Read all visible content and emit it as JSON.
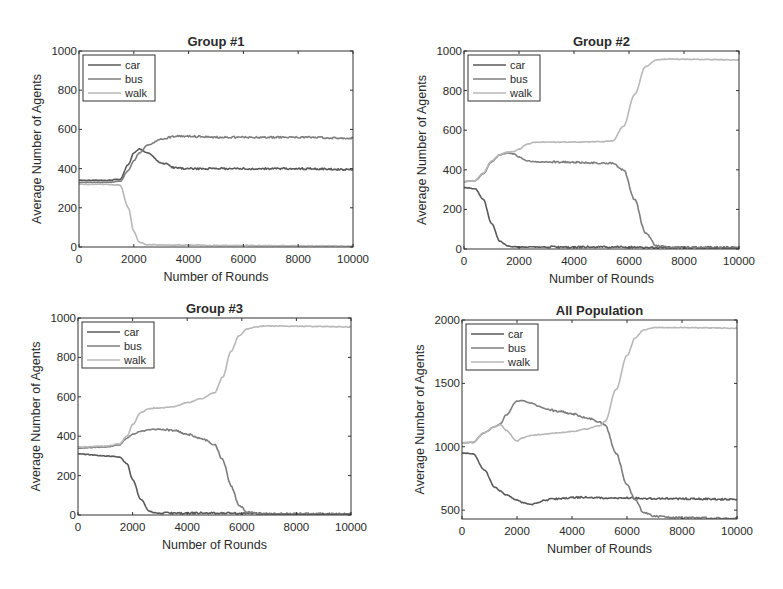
{
  "figure": {
    "background": "#ffffff",
    "colors": {
      "car": "#5a5a5a",
      "bus": "#7e7e7e",
      "walk": "#b8b8b8",
      "axis": "#333333"
    }
  },
  "chart_data": [
    {
      "type": "line",
      "title": "Group #1",
      "xlabel": "Number of Rounds",
      "ylabel": "Average Number of Agents",
      "xlim": [
        0,
        10000
      ],
      "ylim": [
        0,
        1000
      ],
      "xticks": [
        0,
        2000,
        4000,
        6000,
        8000,
        10000
      ],
      "yticks": [
        0,
        200,
        400,
        600,
        800,
        1000
      ],
      "grid": false,
      "legend": {
        "position": "upper left",
        "entries": [
          "car",
          "bus",
          "walk"
        ]
      },
      "box": {
        "x": 79,
        "y": 51,
        "w": 274,
        "h": 196
      },
      "x": [
        0,
        1000,
        1500,
        1800,
        2000,
        2200,
        2500,
        3000,
        3500,
        4000,
        5000,
        6000,
        8000,
        10000
      ],
      "series": [
        {
          "name": "car",
          "values": [
            340,
            340,
            345,
            420,
            480,
            500,
            480,
            430,
            405,
            400,
            400,
            400,
            400,
            395
          ]
        },
        {
          "name": "bus",
          "values": [
            330,
            330,
            335,
            390,
            440,
            480,
            520,
            550,
            565,
            565,
            560,
            560,
            560,
            555
          ]
        },
        {
          "name": "walk",
          "values": [
            320,
            320,
            315,
            200,
            80,
            25,
            12,
            10,
            10,
            10,
            8,
            8,
            6,
            5
          ]
        }
      ]
    },
    {
      "type": "line",
      "title": "Group #2",
      "xlabel": "Number of Rounds",
      "ylabel": "Average Number of Agents",
      "xlim": [
        0,
        10000
      ],
      "ylim": [
        0,
        1000
      ],
      "xticks": [
        0,
        2000,
        4000,
        6000,
        8000,
        10000
      ],
      "yticks": [
        0,
        200,
        400,
        600,
        800,
        1000
      ],
      "grid": false,
      "legend": {
        "position": "upper left",
        "entries": [
          "car",
          "bus",
          "walk"
        ]
      },
      "box": {
        "x": 464,
        "y": 51,
        "w": 275,
        "h": 198
      },
      "x": [
        0,
        400,
        700,
        1000,
        1300,
        1600,
        1800,
        2000,
        2300,
        2600,
        3000,
        4000,
        5000,
        5400,
        5800,
        6200,
        6600,
        7000,
        7500,
        8000,
        10000
      ],
      "series": [
        {
          "name": "car",
          "values": [
            310,
            305,
            250,
            130,
            40,
            15,
            12,
            10,
            10,
            10,
            10,
            10,
            10,
            10,
            10,
            10,
            8,
            8,
            8,
            8,
            8
          ]
        },
        {
          "name": "bus",
          "values": [
            340,
            345,
            380,
            440,
            475,
            485,
            480,
            465,
            445,
            440,
            440,
            438,
            435,
            432,
            400,
            250,
            80,
            15,
            8,
            6,
            5
          ]
        },
        {
          "name": "walk",
          "values": [
            340,
            345,
            385,
            445,
            478,
            490,
            492,
            505,
            530,
            540,
            540,
            540,
            542,
            545,
            620,
            780,
            920,
            955,
            960,
            958,
            955
          ]
        }
      ]
    },
    {
      "type": "line",
      "title": "Group #3",
      "xlabel": "Number of Rounds",
      "ylabel": "Average Number of Agents",
      "xlim": [
        0,
        10000
      ],
      "ylim": [
        0,
        1000
      ],
      "xticks": [
        0,
        2000,
        4000,
        6000,
        8000,
        10000
      ],
      "yticks": [
        0,
        200,
        400,
        600,
        800,
        1000
      ],
      "grid": false,
      "legend": {
        "position": "upper left",
        "entries": [
          "car",
          "bus",
          "walk"
        ]
      },
      "box": {
        "x": 78,
        "y": 318,
        "w": 273,
        "h": 197
      },
      "x": [
        0,
        1000,
        1500,
        1800,
        2000,
        2300,
        2600,
        2800,
        3000,
        3500,
        4000,
        4500,
        5000,
        5300,
        5600,
        5900,
        6200,
        6500,
        7000,
        8000,
        10000
      ],
      "series": [
        {
          "name": "car",
          "values": [
            310,
            300,
            295,
            260,
            180,
            80,
            20,
            12,
            10,
            10,
            10,
            10,
            10,
            10,
            10,
            8,
            8,
            8,
            6,
            5,
            5
          ]
        },
        {
          "name": "bus",
          "values": [
            340,
            345,
            355,
            390,
            410,
            425,
            432,
            435,
            435,
            430,
            410,
            390,
            360,
            280,
            150,
            50,
            15,
            8,
            5,
            5,
            5
          ]
        },
        {
          "name": "walk",
          "values": [
            345,
            350,
            360,
            400,
            460,
            520,
            540,
            542,
            543,
            550,
            570,
            590,
            620,
            700,
            830,
            910,
            945,
            955,
            960,
            958,
            955
          ]
        }
      ]
    },
    {
      "type": "line",
      "title": "All Population",
      "xlabel": "Number of Rounds",
      "ylabel": "Average Number of Agents",
      "xlim": [
        0,
        10000
      ],
      "ylim": [
        430,
        2000
      ],
      "xticks": [
        0,
        2000,
        4000,
        6000,
        8000,
        10000
      ],
      "yticks": [
        500,
        1000,
        1500,
        2000
      ],
      "grid": false,
      "legend": {
        "position": "upper left",
        "entries": [
          "car",
          "bus",
          "walk"
        ]
      },
      "box": {
        "x": 462,
        "y": 320,
        "w": 275,
        "h": 199
      },
      "x": [
        0,
        400,
        800,
        1200,
        1400,
        1600,
        2000,
        2200,
        2500,
        2800,
        3000,
        3500,
        4000,
        4500,
        5000,
        5200,
        5600,
        6000,
        6300,
        6600,
        7000,
        8000,
        10000
      ],
      "series": [
        {
          "name": "car",
          "values": [
            950,
            945,
            820,
            680,
            650,
            620,
            580,
            560,
            545,
            560,
            580,
            590,
            600,
            600,
            598,
            595,
            595,
            595,
            595,
            592,
            592,
            590,
            585
          ]
        },
        {
          "name": "bus",
          "values": [
            1030,
            1035,
            1110,
            1160,
            1180,
            1250,
            1360,
            1365,
            1345,
            1320,
            1300,
            1280,
            1260,
            1230,
            1200,
            1170,
            950,
            700,
            580,
            480,
            450,
            440,
            435
          ]
        },
        {
          "name": "walk",
          "values": [
            1030,
            1035,
            1110,
            1160,
            1175,
            1130,
            1045,
            1070,
            1090,
            1095,
            1100,
            1110,
            1120,
            1140,
            1165,
            1200,
            1450,
            1720,
            1860,
            1920,
            1940,
            1940,
            1935
          ]
        }
      ]
    }
  ]
}
